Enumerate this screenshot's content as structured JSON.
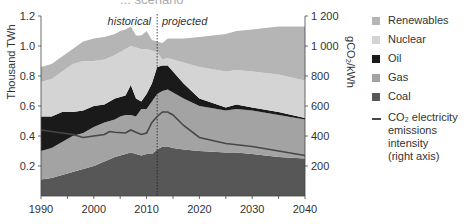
{
  "chart_data": {
    "type": "area",
    "title": "... scenario",
    "xlabel": "",
    "ylabel": "Thousand TWh",
    "y2label": "gCO₂/kWh",
    "xlim": [
      1990,
      2040
    ],
    "ylim": [
      0,
      1.2
    ],
    "y2lim": [
      0,
      1200
    ],
    "x_ticks": [
      "1990",
      "2000",
      "2010",
      "2020",
      "2030",
      "2040"
    ],
    "y_ticks": [
      "0.2",
      "0.4",
      "0.6",
      "0.8",
      "1.0",
      "1.2"
    ],
    "y2_ticks": [
      "200",
      "400",
      "600",
      "800",
      "1 000",
      "1 200"
    ],
    "annotations": [
      "historical",
      "projected"
    ],
    "divider_year": 2012,
    "stacked": true,
    "x": [
      1990,
      1992,
      1994,
      1996,
      1998,
      2000,
      2002,
      2004,
      2005,
      2006,
      2007,
      2008,
      2009,
      2010,
      2011,
      2012,
      2013,
      2014,
      2015,
      2017,
      2020,
      2025,
      2027,
      2030,
      2035,
      2040
    ],
    "series": [
      {
        "name": "Coal",
        "color": "#575757",
        "values": [
          0.11,
          0.12,
          0.14,
          0.16,
          0.18,
          0.2,
          0.23,
          0.26,
          0.27,
          0.28,
          0.29,
          0.28,
          0.27,
          0.28,
          0.28,
          0.31,
          0.33,
          0.33,
          0.32,
          0.31,
          0.3,
          0.29,
          0.29,
          0.28,
          0.26,
          0.25
        ]
      },
      {
        "name": "Gas",
        "color": "#a3a3a3",
        "values": [
          0.19,
          0.2,
          0.22,
          0.24,
          0.24,
          0.26,
          0.26,
          0.25,
          0.26,
          0.26,
          0.25,
          0.25,
          0.31,
          0.3,
          0.35,
          0.37,
          0.37,
          0.38,
          0.37,
          0.34,
          0.3,
          0.28,
          0.29,
          0.29,
          0.28,
          0.26
        ]
      },
      {
        "name": "Oil",
        "color": "#1a1a1a",
        "values": [
          0.23,
          0.21,
          0.2,
          0.16,
          0.15,
          0.14,
          0.12,
          0.14,
          0.13,
          0.13,
          0.2,
          0.12,
          0.05,
          0.1,
          0.12,
          0.18,
          0.17,
          0.16,
          0.14,
          0.1,
          0.05,
          0.02,
          0.03,
          0.02,
          0.02,
          0.01
        ]
      },
      {
        "name": "Nuclear",
        "color": "#d4d4d4",
        "values": [
          0.23,
          0.25,
          0.27,
          0.32,
          0.33,
          0.3,
          0.3,
          0.29,
          0.3,
          0.31,
          0.26,
          0.34,
          0.35,
          0.3,
          0.22,
          0.1,
          0.04,
          0.05,
          0.08,
          0.14,
          0.21,
          0.24,
          0.23,
          0.24,
          0.25,
          0.25
        ]
      },
      {
        "name": "Renewables",
        "color": "#b5b5b5",
        "values": [
          0.1,
          0.1,
          0.1,
          0.1,
          0.13,
          0.15,
          0.15,
          0.14,
          0.14,
          0.13,
          0.13,
          0.08,
          0.09,
          0.12,
          0.07,
          0.07,
          0.11,
          0.13,
          0.14,
          0.16,
          0.2,
          0.25,
          0.26,
          0.28,
          0.32,
          0.36
        ]
      }
    ],
    "line_series": {
      "name": "CO₂ electricity emissions intensity (right axis)",
      "axis": "right",
      "color": "#474747",
      "x": [
        1990,
        1992,
        1994,
        1996,
        1998,
        2000,
        2002,
        2003,
        2004,
        2006,
        2007,
        2008,
        2009,
        2010,
        2011,
        2012,
        2013,
        2014,
        2015,
        2017,
        2020,
        2025,
        2030,
        2035,
        2040
      ],
      "values": [
        440,
        430,
        420,
        410,
        390,
        400,
        410,
        430,
        425,
        420,
        440,
        425,
        410,
        420,
        490,
        530,
        560,
        560,
        540,
        470,
        390,
        350,
        330,
        300,
        270
      ]
    },
    "legend_position": "right",
    "grid": false
  },
  "legend": {
    "items": [
      {
        "label": "Renewables",
        "color": "#b5b5b5"
      },
      {
        "label": "Nuclear",
        "color": "#d4d4d4"
      },
      {
        "label": "Oil",
        "color": "#1a1a1a"
      },
      {
        "label": "Gas",
        "color": "#a3a3a3"
      },
      {
        "label": "Coal",
        "color": "#575757"
      }
    ],
    "line_item": {
      "label_line1": "CO₂ electricity",
      "label_line2": "emissions intensity",
      "label_line3": "(right axis)",
      "color": "#474747"
    }
  }
}
